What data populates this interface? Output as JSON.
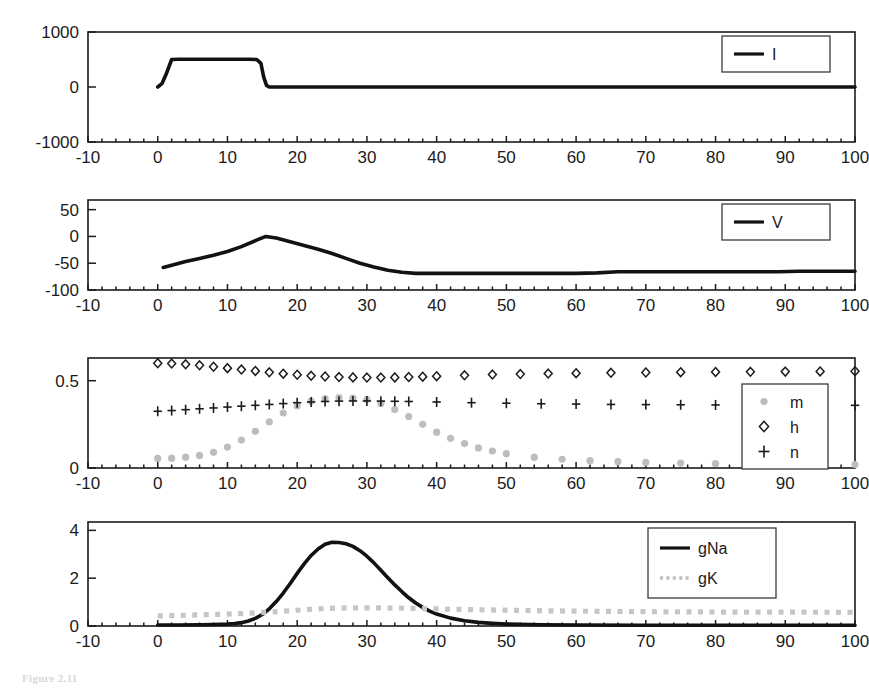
{
  "figure": {
    "caption": "Figure 2.11",
    "x_axis": {
      "label": "",
      "min": -10,
      "max": 100,
      "ticks": [
        -10,
        0,
        10,
        20,
        30,
        40,
        50,
        60,
        70,
        80,
        90,
        100
      ],
      "tick_labels": [
        "-10",
        "0",
        "10",
        "20",
        "30",
        "40",
        "50",
        "60",
        "70",
        "80",
        "90",
        "100"
      ]
    }
  },
  "colors": {
    "line_black": "#121212",
    "marker_gray": "#bdbdbd",
    "axis": "#1b1b1b",
    "background": "#ffffff"
  },
  "chart_data": [
    {
      "type": "line",
      "panel": 1,
      "title": "",
      "xlabel": "",
      "ylabel": "",
      "xlim": [
        -10,
        100
      ],
      "ylim": [
        -1000,
        1000
      ],
      "yticks": [
        -1000,
        0,
        1000
      ],
      "ytick_labels": [
        "-1000",
        "0",
        "1000"
      ],
      "xticks": [
        -10,
        0,
        10,
        20,
        30,
        40,
        50,
        60,
        70,
        80,
        90,
        100
      ],
      "grid": false,
      "legend": {
        "position": "top-right",
        "entries": [
          {
            "label": "I",
            "style": "solid-line",
            "color": "#121212"
          }
        ]
      },
      "series": [
        {
          "name": "I",
          "style": "solid",
          "x": [
            0,
            0.6,
            1.2,
            2.0,
            3,
            5,
            8,
            11,
            13,
            14.2,
            14.8,
            15.2,
            15.6,
            16,
            18,
            22,
            30,
            40,
            50,
            60,
            70,
            80,
            90,
            100
          ],
          "values": [
            0,
            60,
            230,
            500,
            505,
            505,
            505,
            505,
            505,
            500,
            430,
            180,
            30,
            0,
            0,
            0,
            0,
            0,
            0,
            0,
            0,
            0,
            0,
            0
          ]
        }
      ]
    },
    {
      "type": "line",
      "panel": 2,
      "title": "",
      "xlabel": "",
      "ylabel": "",
      "xlim": [
        -10,
        100
      ],
      "ylim": [
        -100,
        68
      ],
      "yticks": [
        -100,
        -50,
        0,
        50
      ],
      "ytick_labels": [
        "-100",
        "-50",
        "0",
        "50"
      ],
      "xticks": [
        -10,
        0,
        10,
        20,
        30,
        40,
        50,
        60,
        70,
        80,
        90,
        100
      ],
      "grid": false,
      "legend": {
        "position": "top-right",
        "entries": [
          {
            "label": "V",
            "style": "solid-line",
            "color": "#121212"
          }
        ]
      },
      "series": [
        {
          "name": "V",
          "style": "solid",
          "x": [
            0.8,
            2,
            4,
            6,
            8,
            10,
            12,
            14,
            15.5,
            17,
            19,
            21,
            23,
            25,
            27,
            29,
            31,
            33,
            35,
            37,
            40,
            45,
            50,
            55,
            60,
            63,
            66,
            70,
            75,
            80,
            85,
            89,
            92,
            96,
            100
          ],
          "values": [
            -58,
            -54,
            -47,
            -41,
            -35,
            -28,
            -19,
            -8,
            0,
            -3,
            -10,
            -17,
            -24,
            -32,
            -41,
            -50,
            -57,
            -63,
            -67,
            -69,
            -69,
            -69,
            -69,
            -69,
            -69,
            -68,
            -66,
            -66,
            -66,
            -66,
            -66,
            -66,
            -65,
            -65,
            -65
          ]
        }
      ]
    },
    {
      "type": "scatter",
      "panel": 3,
      "title": "",
      "xlabel": "",
      "ylabel": "",
      "xlim": [
        -10,
        100
      ],
      "ylim": [
        0,
        0.63
      ],
      "yticks": [
        0,
        0.5
      ],
      "ytick_labels": [
        "0",
        "0.5"
      ],
      "xticks": [
        -10,
        0,
        10,
        20,
        30,
        40,
        50,
        60,
        70,
        80,
        90,
        100
      ],
      "grid": false,
      "legend": {
        "position": "right",
        "entries": [
          {
            "label": "m",
            "style": "dot-marker",
            "color": "#bdbdbd"
          },
          {
            "label": "h",
            "style": "diamond-marker",
            "color": "#1b1b1b"
          },
          {
            "label": "n",
            "style": "plus-marker",
            "color": "#1b1b1b"
          }
        ]
      },
      "series": [
        {
          "name": "m",
          "style": "dot",
          "x": [
            0,
            2,
            4,
            6,
            8,
            10,
            12,
            14,
            16,
            18,
            20,
            22,
            24,
            26,
            28,
            30,
            32,
            34,
            36,
            38,
            40,
            42,
            44,
            46,
            48,
            50,
            54,
            58,
            62,
            66,
            70,
            75,
            80,
            85,
            90,
            95,
            100
          ],
          "values": [
            0.055,
            0.056,
            0.062,
            0.072,
            0.09,
            0.12,
            0.16,
            0.21,
            0.265,
            0.315,
            0.355,
            0.383,
            0.398,
            0.403,
            0.4,
            0.392,
            0.37,
            0.335,
            0.295,
            0.25,
            0.205,
            0.17,
            0.14,
            0.115,
            0.097,
            0.082,
            0.062,
            0.05,
            0.042,
            0.036,
            0.032,
            0.028,
            0.025,
            0.023,
            0.022,
            0.021,
            0.02
          ]
        },
        {
          "name": "h",
          "style": "diamond",
          "x": [
            0,
            2,
            4,
            6,
            8,
            10,
            12,
            14,
            16,
            18,
            20,
            22,
            24,
            26,
            28,
            30,
            32,
            34,
            36,
            38,
            40,
            44,
            48,
            52,
            56,
            60,
            65,
            70,
            75,
            80,
            85,
            90,
            95,
            100
          ],
          "values": [
            0.6,
            0.598,
            0.594,
            0.588,
            0.58,
            0.572,
            0.564,
            0.556,
            0.548,
            0.54,
            0.534,
            0.528,
            0.524,
            0.521,
            0.519,
            0.518,
            0.518,
            0.519,
            0.521,
            0.523,
            0.526,
            0.531,
            0.535,
            0.538,
            0.541,
            0.543,
            0.545,
            0.547,
            0.549,
            0.55,
            0.551,
            0.552,
            0.553,
            0.554
          ]
        },
        {
          "name": "n",
          "style": "plus",
          "x": [
            0,
            2,
            4,
            6,
            8,
            10,
            12,
            14,
            16,
            18,
            20,
            22,
            24,
            26,
            28,
            30,
            32,
            34,
            36,
            40,
            45,
            50,
            55,
            60,
            65,
            70,
            75,
            80,
            85,
            90,
            95,
            100
          ],
          "values": [
            0.325,
            0.329,
            0.334,
            0.339,
            0.344,
            0.349,
            0.354,
            0.359,
            0.364,
            0.369,
            0.374,
            0.378,
            0.381,
            0.383,
            0.384,
            0.384,
            0.383,
            0.382,
            0.381,
            0.378,
            0.374,
            0.371,
            0.368,
            0.366,
            0.364,
            0.363,
            0.362,
            0.361,
            0.36,
            0.36,
            0.359,
            0.359
          ]
        }
      ]
    },
    {
      "type": "line",
      "panel": 4,
      "title": "",
      "xlabel": "",
      "ylabel": "",
      "xlim": [
        -10,
        100
      ],
      "ylim": [
        0,
        4.35
      ],
      "yticks": [
        0,
        2,
        4
      ],
      "ytick_labels": [
        "0",
        "2",
        "4"
      ],
      "xticks": [
        -10,
        0,
        10,
        20,
        30,
        40,
        50,
        60,
        70,
        80,
        90,
        100
      ],
      "grid": false,
      "legend": {
        "position": "top-right",
        "entries": [
          {
            "label": "gNa",
            "style": "solid-line",
            "color": "#121212"
          },
          {
            "label": "gK",
            "style": "dotted-line",
            "color": "#c6c6c6"
          }
        ]
      },
      "series": [
        {
          "name": "gNa",
          "style": "solid",
          "x": [
            0,
            3,
            6,
            8,
            10,
            11,
            12,
            13,
            14,
            15,
            16,
            17,
            18,
            19,
            20,
            21,
            22,
            23,
            24,
            25,
            26,
            27,
            28,
            29,
            30,
            31,
            32,
            33,
            34,
            35,
            36,
            37,
            38,
            39,
            40,
            42,
            44,
            46,
            48,
            50,
            55,
            60,
            70,
            80,
            90,
            100
          ],
          "values": [
            0.04,
            0.04,
            0.05,
            0.06,
            0.08,
            0.1,
            0.14,
            0.21,
            0.32,
            0.48,
            0.72,
            1.02,
            1.38,
            1.78,
            2.2,
            2.6,
            2.95,
            3.22,
            3.42,
            3.5,
            3.49,
            3.44,
            3.33,
            3.15,
            2.92,
            2.64,
            2.33,
            2.02,
            1.72,
            1.44,
            1.18,
            0.96,
            0.78,
            0.62,
            0.5,
            0.33,
            0.22,
            0.15,
            0.11,
            0.08,
            0.05,
            0.04,
            0.03,
            0.03,
            0.03,
            0.03
          ]
        },
        {
          "name": "gK",
          "style": "dotted",
          "x": [
            0,
            4,
            8,
            12,
            14,
            16,
            18,
            20,
            22,
            24,
            26,
            28,
            30,
            34,
            38,
            42,
            46,
            50,
            55,
            60,
            65,
            70,
            75,
            80,
            85,
            90,
            95,
            100
          ],
          "values": [
            0.42,
            0.45,
            0.48,
            0.52,
            0.55,
            0.58,
            0.62,
            0.66,
            0.7,
            0.73,
            0.75,
            0.76,
            0.76,
            0.75,
            0.73,
            0.7,
            0.68,
            0.66,
            0.64,
            0.62,
            0.61,
            0.6,
            0.59,
            0.585,
            0.58,
            0.578,
            0.575,
            0.572
          ]
        }
      ]
    }
  ]
}
